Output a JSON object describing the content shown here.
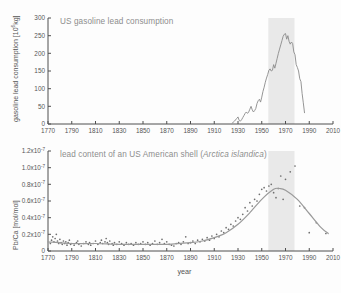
{
  "figure": {
    "background": "#fdfdfd",
    "line_color": "#8a8a8a",
    "point_color": "#6f6f6f",
    "axis_color": "#4f4f4f",
    "band_color": "#e9e9e9",
    "title_color": "#8d8d8d"
  },
  "panels": {
    "top": {
      "title": "US gasoline lead consumption",
      "ylabel_text": "gasoline lead consumption [10",
      "ylabel_exp": "6",
      "ylabel_tail": "kg]",
      "ytick_labels": [
        "0",
        "50",
        "100",
        "150",
        "200",
        "250",
        "300"
      ],
      "xtick_labels": [
        "1770",
        "1790",
        "1810",
        "1830",
        "1850",
        "1870",
        "1890",
        "1910",
        "1930",
        "1950",
        "1970",
        "1990",
        "2010"
      ]
    },
    "bottom": {
      "title_main": "lead content of an US American shell (",
      "title_species": "Arctica islandica",
      "title_end": ")",
      "ylabel": "Pb/Ca [mol/mol]",
      "xlabel": "year",
      "ytick_labels": [
        "0",
        "0.2x10",
        "0.4x10",
        "0.6x10",
        "0.8x10",
        "1.0x10",
        "1.2x10"
      ],
      "ytick_exp": "-7",
      "xtick_labels": [
        "1770",
        "1790",
        "1810",
        "1830",
        "1850",
        "1870",
        "1890",
        "1910",
        "1930",
        "1950",
        "1970",
        "1990",
        "2010"
      ]
    }
  },
  "chart_data": [
    {
      "type": "line",
      "title": "US gasoline lead consumption",
      "xlabel": "",
      "ylabel": "gasoline lead consumption [10^6 kg]",
      "xlim": [
        1770,
        2010
      ],
      "ylim": [
        0,
        300
      ],
      "grid": false,
      "legend": "none",
      "shaded_band": {
        "x0": 1968,
        "x1": 1990,
        "color": "#e9e9e9"
      },
      "x": [
        1925,
        1927,
        1929,
        1930,
        1931,
        1932,
        1933,
        1934,
        1935,
        1936,
        1937,
        1938,
        1939,
        1940,
        1941,
        1942,
        1943,
        1944,
        1945,
        1946,
        1947,
        1948,
        1949,
        1950,
        1951,
        1952,
        1953,
        1954,
        1955,
        1956,
        1957,
        1958,
        1959,
        1960,
        1961,
        1962,
        1963,
        1964,
        1965,
        1966,
        1967,
        1968,
        1969,
        1970,
        1971,
        1972,
        1973,
        1974,
        1975,
        1976,
        1977,
        1978,
        1979,
        1980,
        1981,
        1982,
        1983,
        1984,
        1985,
        1986
      ],
      "values": [
        2,
        8,
        16,
        20,
        10,
        8,
        12,
        18,
        24,
        30,
        34,
        30,
        34,
        42,
        50,
        40,
        34,
        38,
        44,
        58,
        66,
        70,
        62,
        76,
        92,
        104,
        118,
        130,
        140,
        152,
        156,
        150,
        152,
        168,
        158,
        172,
        186,
        200,
        212,
        224,
        236,
        248,
        254,
        256,
        240,
        250,
        234,
        226,
        232,
        228,
        204,
        196,
        168,
        160,
        150,
        128,
        120,
        86,
        60,
        32
      ]
    },
    {
      "type": "scatter",
      "title": "lead content of an US American shell (Arctica islandica)",
      "xlabel": "year",
      "ylabel": "Pb/Ca [mol/mol]",
      "xlim": [
        1770,
        2010
      ],
      "ylim": [
        0,
        1.3e-07
      ],
      "y_exponent": -7,
      "grid": false,
      "legend": "none",
      "shaded_band": {
        "x0": 1968,
        "x1": 1990,
        "color": "#e9e9e9"
      },
      "points": [
        [
          1772,
          0.09
        ],
        [
          1773,
          0.13
        ],
        [
          1774,
          0.17
        ],
        [
          1775,
          0.11
        ],
        [
          1776,
          0.15
        ],
        [
          1777,
          0.2
        ],
        [
          1778,
          0.12
        ],
        [
          1779,
          0.09
        ],
        [
          1780,
          0.14
        ],
        [
          1781,
          0.1
        ],
        [
          1782,
          0.08
        ],
        [
          1783,
          0.12
        ],
        [
          1784,
          0.09
        ],
        [
          1785,
          0.11
        ],
        [
          1786,
          0.07
        ],
        [
          1787,
          0.1
        ],
        [
          1788,
          0.13
        ],
        [
          1789,
          0.08
        ],
        [
          1790,
          0.09
        ],
        [
          1792,
          0.07
        ],
        [
          1794,
          0.1
        ],
        [
          1795,
          0.12
        ],
        [
          1796,
          0.08
        ],
        [
          1798,
          0.06
        ],
        [
          1800,
          0.09
        ],
        [
          1802,
          0.11
        ],
        [
          1804,
          0.08
        ],
        [
          1805,
          0.1
        ],
        [
          1806,
          0.07
        ],
        [
          1808,
          0.09
        ],
        [
          1810,
          0.12
        ],
        [
          1812,
          0.08
        ],
        [
          1814,
          0.1
        ],
        [
          1815,
          0.13
        ],
        [
          1816,
          0.09
        ],
        [
          1818,
          0.11
        ],
        [
          1819,
          0.15
        ],
        [
          1820,
          0.1
        ],
        [
          1821,
          0.08
        ],
        [
          1822,
          0.12
        ],
        [
          1824,
          0.09
        ],
        [
          1825,
          0.07
        ],
        [
          1826,
          0.1
        ],
        [
          1828,
          0.08
        ],
        [
          1830,
          0.11
        ],
        [
          1832,
          0.09
        ],
        [
          1834,
          0.07
        ],
        [
          1836,
          0.1
        ],
        [
          1838,
          0.08
        ],
        [
          1840,
          0.09
        ],
        [
          1842,
          0.07
        ],
        [
          1844,
          0.1
        ],
        [
          1846,
          0.08
        ],
        [
          1848,
          0.09
        ],
        [
          1850,
          0.11
        ],
        [
          1852,
          0.08
        ],
        [
          1854,
          0.1
        ],
        [
          1856,
          0.07
        ],
        [
          1858,
          0.09
        ],
        [
          1860,
          0.12
        ],
        [
          1862,
          0.08
        ],
        [
          1864,
          0.1
        ],
        [
          1866,
          0.14
        ],
        [
          1868,
          0.09
        ],
        [
          1870,
          0.11
        ],
        [
          1872,
          0.08
        ],
        [
          1874,
          0.07
        ],
        [
          1876,
          0.06
        ],
        [
          1878,
          0.09
        ],
        [
          1880,
          0.1
        ],
        [
          1882,
          0.08
        ],
        [
          1884,
          0.11
        ],
        [
          1886,
          0.17
        ],
        [
          1888,
          0.09
        ],
        [
          1890,
          0.1
        ],
        [
          1892,
          0.12
        ],
        [
          1894,
          0.09
        ],
        [
          1896,
          0.13
        ],
        [
          1898,
          0.11
        ],
        [
          1900,
          0.14
        ],
        [
          1902,
          0.12
        ],
        [
          1904,
          0.16
        ],
        [
          1906,
          0.13
        ],
        [
          1908,
          0.18
        ],
        [
          1910,
          0.15
        ],
        [
          1912,
          0.2
        ],
        [
          1914,
          0.17
        ],
        [
          1916,
          0.24
        ],
        [
          1918,
          0.22
        ],
        [
          1920,
          0.28
        ],
        [
          1922,
          0.26
        ],
        [
          1924,
          0.32
        ],
        [
          1926,
          0.3
        ],
        [
          1928,
          0.36
        ],
        [
          1930,
          0.4
        ],
        [
          1932,
          0.38
        ],
        [
          1934,
          0.44
        ],
        [
          1936,
          0.52
        ],
        [
          1938,
          0.48
        ],
        [
          1940,
          0.58
        ],
        [
          1942,
          0.54
        ],
        [
          1944,
          0.62
        ],
        [
          1946,
          0.6
        ],
        [
          1948,
          0.68
        ],
        [
          1950,
          0.74
        ],
        [
          1952,
          0.76
        ],
        [
          1954,
          0.72
        ],
        [
          1956,
          0.78
        ],
        [
          1958,
          0.8
        ],
        [
          1960,
          0.7
        ],
        [
          1962,
          0.64
        ],
        [
          1964,
          0.75
        ],
        [
          1966,
          0.9
        ],
        [
          1968,
          0.62
        ],
        [
          1970,
          0.86
        ],
        [
          1974,
          0.95
        ],
        [
          1978,
          1.02
        ],
        [
          1982,
          0.54
        ],
        [
          1986,
          0.52
        ],
        [
          1990,
          0.22
        ],
        [
          1996,
          0.34
        ],
        [
          2004,
          0.21
        ]
      ],
      "fit_curve": {
        "description": "smoothed trend line through Pb/Ca points",
        "x": [
          1770,
          1790,
          1810,
          1830,
          1850,
          1870,
          1890,
          1900,
          1910,
          1920,
          1930,
          1940,
          1950,
          1960,
          1965,
          1970,
          1980,
          1990,
          2000,
          2006
        ],
        "values": [
          0.11,
          0.09,
          0.09,
          0.08,
          0.08,
          0.08,
          0.1,
          0.12,
          0.16,
          0.22,
          0.32,
          0.46,
          0.62,
          0.74,
          0.75,
          0.73,
          0.62,
          0.45,
          0.28,
          0.21
        ]
      }
    }
  ]
}
